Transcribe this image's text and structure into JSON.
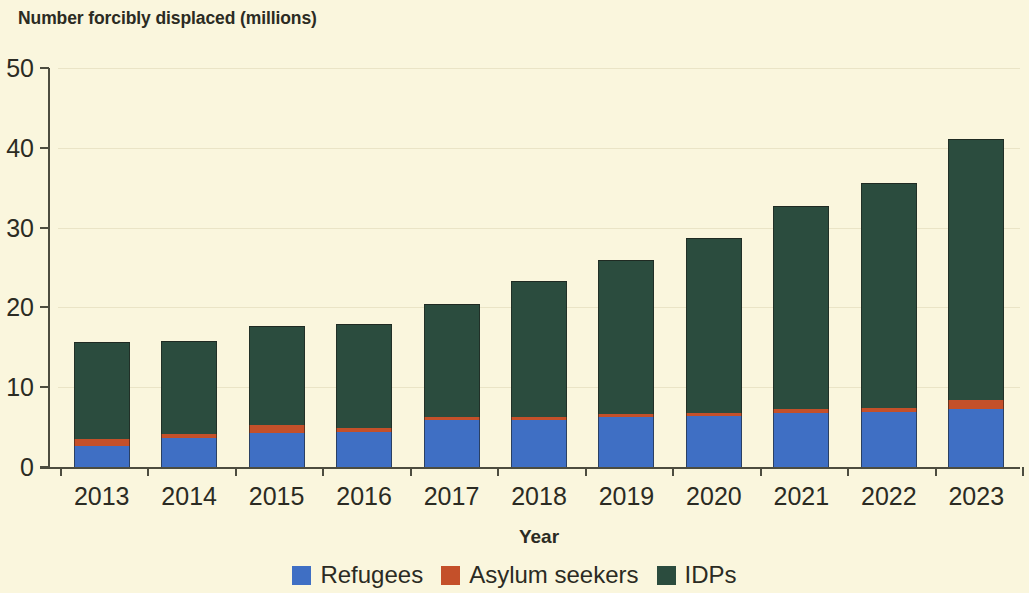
{
  "chart_data": {
    "type": "bar",
    "stacked": true,
    "title": "Number forcibly displaced (millions)",
    "xlabel": "Year",
    "ylabel": "",
    "categories": [
      "2013",
      "2014",
      "2015",
      "2016",
      "2017",
      "2018",
      "2019",
      "2020",
      "2021",
      "2022",
      "2023"
    ],
    "series": [
      {
        "name": "Refugees",
        "color": "#3f6fc4",
        "values": [
          2.6,
          3.6,
          4.3,
          4.4,
          5.9,
          5.9,
          6.3,
          6.4,
          6.8,
          6.9,
          7.3
        ]
      },
      {
        "name": "Asylum seekers",
        "color": "#c4502a",
        "values": [
          0.9,
          0.5,
          1.0,
          0.5,
          0.4,
          0.4,
          0.4,
          0.4,
          0.5,
          0.5,
          1.1
        ]
      },
      {
        "name": "IDPs",
        "color": "#2b4c3e",
        "values": [
          12.2,
          11.7,
          12.4,
          13.0,
          14.1,
          17.0,
          19.2,
          21.9,
          25.4,
          28.2,
          32.7
        ]
      }
    ],
    "totals": [
      15.7,
      15.8,
      17.7,
      17.9,
      20.4,
      23.3,
      25.9,
      28.7,
      32.7,
      35.6,
      41.1
    ],
    "ylim": [
      0,
      50
    ],
    "yticks": [
      "0",
      "10",
      "20",
      "30",
      "40",
      "50"
    ],
    "grid": true,
    "legend_position": "bottom"
  },
  "legend": {
    "items": [
      {
        "label": "Refugees",
        "color": "#3f6fc4"
      },
      {
        "label": "Asylum seekers",
        "color": "#c4502a"
      },
      {
        "label": "IDPs",
        "color": "#2b4c3e"
      }
    ]
  },
  "colors": {
    "background": "#faf6dd",
    "axis": "#4c4c3f",
    "grid": "#eae4c6",
    "text": "#2b2b23"
  }
}
